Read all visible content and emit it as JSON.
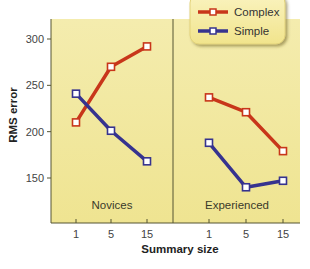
{
  "chart_data": {
    "type": "line",
    "title": "",
    "ylabel": "RMS error",
    "xlabel": "Summary size",
    "ylim": [
      110,
      320
    ],
    "yticks": [
      150,
      200,
      250,
      300
    ],
    "grid": false,
    "legend_position": "top-right",
    "panels": [
      {
        "label": "Novices",
        "categories": [
          "1",
          "5",
          "15"
        ],
        "series": [
          {
            "name": "Complex",
            "color": "#c8361a",
            "values": [
              210,
              270,
              292
            ]
          },
          {
            "name": "Simple",
            "color": "#36338f",
            "values": [
              241,
              201,
              168
            ]
          }
        ]
      },
      {
        "label": "Experienced",
        "categories": [
          "1",
          "5",
          "15"
        ],
        "series": [
          {
            "name": "Complex",
            "color": "#c8361a",
            "values": [
              237,
              221,
              179
            ]
          },
          {
            "name": "Simple",
            "color": "#36338f",
            "values": [
              188,
              140,
              147
            ]
          }
        ]
      }
    ],
    "legend": [
      {
        "name": "Complex",
        "color": "#c8361a"
      },
      {
        "name": "Simple",
        "color": "#36338f"
      }
    ]
  },
  "colors": {
    "plot_background": "#f3eba6",
    "legend_background": "#f5eba0",
    "axis": "#555533"
  }
}
